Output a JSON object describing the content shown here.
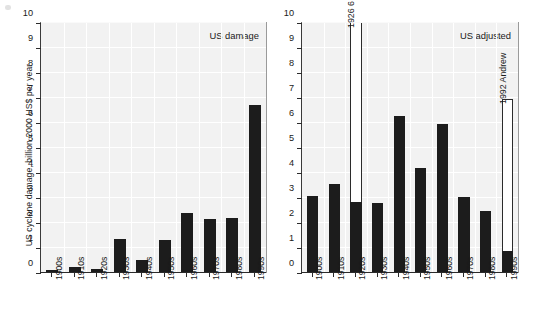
{
  "figure": {
    "ylabel": "US cyclone damage, billion 2000 US$ per year",
    "yticks": [
      "0",
      "1",
      "2",
      "3",
      "4",
      "5",
      "6",
      "7",
      "8",
      "9",
      "10"
    ],
    "ylim": [
      0,
      10
    ]
  },
  "panels": [
    {
      "key": "us_damage",
      "title": "US damage",
      "categories": [
        "1900s",
        "1910s",
        "1920s",
        "1930s",
        "1940s",
        "1950s",
        "1960s",
        "1970s",
        "1980s",
        "1990s"
      ],
      "values": [
        0.14,
        0.24,
        0.18,
        1.36,
        0.54,
        1.31,
        2.4,
        2.15,
        2.2,
        6.72
      ],
      "annotations": []
    },
    {
      "key": "us_adjusted",
      "title": "US adjusted",
      "categories": [
        "1900s",
        "1910s",
        "1920s",
        "1930s",
        "1940s",
        "1950s",
        "1960s",
        "1970s",
        "1980s",
        "1990s"
      ],
      "values": [
        3.08,
        3.57,
        2.85,
        2.79,
        6.3,
        4.2,
        5.98,
        3.05,
        2.5,
        0.88
      ],
      "extensions": [
        {
          "category": "1920s",
          "top": 10.0,
          "label": "1926 6 (Dade & Broward)",
          "clipped": true
        },
        {
          "category": "1990s",
          "top": 6.95,
          "label": "1992 Andrew",
          "clipped": false
        }
      ],
      "annotations": [
        "1926 6 (Dade & Broward)",
        "1992 Andrew"
      ]
    }
  ],
  "chart_data": {
    "type": "bar",
    "title": "",
    "xlabel": "",
    "ylabel": "US cyclone damage, billion 2000 US$ per year",
    "ylim": [
      0,
      10
    ],
    "ytick_values": [
      0,
      1,
      2,
      3,
      4,
      5,
      6,
      7,
      8,
      9,
      10
    ],
    "grid": true,
    "legend": "none",
    "panel_layout": "1x2",
    "categories": [
      "1900s",
      "1910s",
      "1920s",
      "1930s",
      "1940s",
      "1950s",
      "1960s",
      "1970s",
      "1980s",
      "1990s"
    ],
    "series": [
      {
        "name": "US damage",
        "panel": "left",
        "values": [
          0.14,
          0.24,
          0.18,
          1.36,
          0.54,
          1.31,
          2.4,
          2.15,
          2.2,
          6.72
        ]
      },
      {
        "name": "US adjusted",
        "panel": "right",
        "values": [
          3.08,
          3.57,
          2.85,
          2.79,
          6.3,
          4.2,
          5.98,
          3.05,
          2.5,
          0.88
        ],
        "outlier_extensions": [
          {
            "category": "1920s",
            "extends_to": 10.0,
            "note": "off scale",
            "annotation": "1926 6 (Dade & Broward)"
          },
          {
            "category": "1990s",
            "extends_to": 6.95,
            "note": "on scale",
            "annotation": "1992 Andrew"
          }
        ]
      }
    ],
    "annotations": [
      {
        "text": "1926 6 (Dade & Broward)",
        "panel": "right",
        "category": "1920s",
        "rotation": 90
      },
      {
        "text": "1992 Andrew",
        "panel": "right",
        "category": "1990s",
        "rotation": 90
      }
    ]
  }
}
